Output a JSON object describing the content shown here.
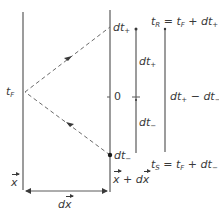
{
  "diagram": {
    "type": "spacetime light-signal diagram",
    "colors": {
      "line": "#5a5a5a",
      "text": "#3a3a3a",
      "dashed": "#6a6a6a"
    },
    "labels": {
      "t_F": {
        "main": "t",
        "sub": "F"
      },
      "dt_plus_top": {
        "main": "dt",
        "sub": "+"
      },
      "dt_minus_bottom": {
        "main": "dt",
        "sub": "−"
      },
      "zero": "0",
      "dt_plus_mid": {
        "main": "dt",
        "sub": "+"
      },
      "dt_minus_mid": {
        "main": "dt",
        "sub": "−"
      },
      "t_R_eq": {
        "lhs": "t",
        "lhs_sub": "R",
        "eq": " = ",
        "rhs": "t",
        "rhs_sub": "F",
        "plus": " + dt",
        "plus_sub": "+"
      },
      "t_S_eq": {
        "lhs": "t",
        "lhs_sub": "S",
        "eq": " = ",
        "rhs": "t",
        "rhs_sub": "F",
        "plus": " + dt",
        "plus_sub": "−"
      },
      "diff": {
        "a": "dt",
        "a_sub": "+",
        "op": " − dt",
        "b_sub": "−"
      },
      "x": "x",
      "x_plus_dx": {
        "x": "x",
        "plus": " + d",
        "dx": "x"
      },
      "dx": {
        "d": "d",
        "x": "x"
      }
    }
  }
}
